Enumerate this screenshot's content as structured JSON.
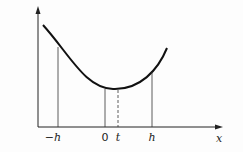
{
  "figure": {
    "x_axis_label": "x",
    "tick_labels": {
      "neg_h": "−h",
      "zero": "0",
      "t": "t",
      "h": "h"
    }
  }
}
